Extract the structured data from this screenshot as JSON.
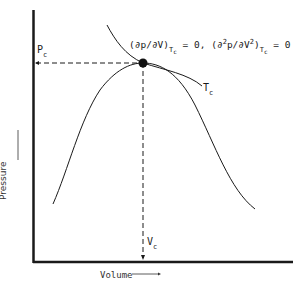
{
  "figure": {
    "x_axis_label": "Volume",
    "y_axis_label": "Pressure",
    "critical_pressure_label": "P",
    "critical_pressure_sub": "c",
    "critical_volume_label": "V",
    "critical_volume_sub": "c",
    "isotherm_label": "T",
    "isotherm_sub": "c",
    "condition": {
      "part1": "(∂p/∂V)",
      "part1_sub": "T",
      "part1_subsub": "c",
      "part1_eq": " = 0, ",
      "part2_open": "(∂",
      "part2_sup": "2",
      "part2_mid": "p/∂V",
      "part2_sup2": "2",
      "part2_close": ")",
      "part2_sub": "T",
      "part2_subsub": "c",
      "part2_eq": " = 0"
    },
    "colors": {
      "line": "#1a1a1a",
      "background": "#ffffff"
    }
  }
}
